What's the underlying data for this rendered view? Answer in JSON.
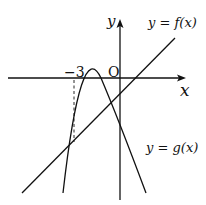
{
  "diagram": {
    "axes": {
      "x_label": "x",
      "y_label": "y",
      "origin_label": "O"
    },
    "tick_label": "−3",
    "curves": {
      "f": {
        "label": "y = f(x)",
        "type": "line"
      },
      "g": {
        "label": "y = g(x)",
        "type": "parabola"
      }
    },
    "annotation": "dashed vertical line from x = -3 to intersection of f and g"
  }
}
